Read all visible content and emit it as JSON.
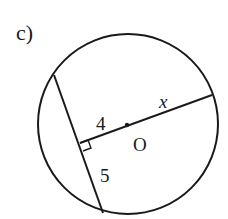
{
  "problem": {
    "label": "c)"
  },
  "diagram": {
    "center_label": "O",
    "segment_to_center_label": "4",
    "half_chord_label": "5",
    "radius_label": "x",
    "right_angle_marker": true,
    "stroke_color": "#1a1a1a",
    "background_color": "#ffffff"
  }
}
